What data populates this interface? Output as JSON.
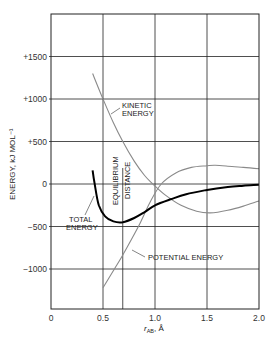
{
  "chart_data": {
    "type": "line",
    "title": "",
    "xlabel": "r_AB, Å",
    "xlabel_main": "r",
    "xlabel_sub": "AB",
    "xlabel_unit": ", Å",
    "ylabel": "ENERGY, kJ MOL⁻¹",
    "xlim": [
      0,
      2.0
    ],
    "ylim": [
      -1470,
      1980
    ],
    "grid": true,
    "legend_position": "inline annotations",
    "x_ticks": [
      0,
      0.5,
      1.0,
      1.5,
      2.0
    ],
    "x_tick_labels": [
      "0",
      "0.5",
      "1.0",
      "1.5",
      "2.0"
    ],
    "y_ticks": [
      1500,
      1000,
      500,
      0,
      -500,
      -1000
    ],
    "y_tick_labels": [
      "+1500",
      "+1000",
      "+500",
      "0",
      "−500",
      "−1000"
    ],
    "series": [
      {
        "name": "KINETIC ENERGY",
        "color": "#8a8a8a",
        "x": [
          0.4,
          0.5,
          0.6,
          0.69,
          0.8,
          0.9,
          0.98,
          1.1,
          1.25,
          1.4,
          1.53,
          1.7,
          1.85,
          2.0
        ],
        "y": [
          1300,
          1000,
          720,
          500,
          270,
          100,
          0,
          -130,
          -250,
          -320,
          -340,
          -310,
          -260,
          -200
        ]
      },
      {
        "name": "POTENTIAL ENERGY",
        "color": "#8a8a8a",
        "x": [
          0.5,
          0.61,
          0.69,
          0.84,
          0.95,
          1.06,
          1.2,
          1.35,
          1.5,
          1.58,
          1.7,
          1.85,
          2.0
        ],
        "y": [
          -1220,
          -1000,
          -835,
          -500,
          -220,
          0,
          130,
          195,
          215,
          220,
          210,
          195,
          180
        ]
      },
      {
        "name": "TOTAL ENERGY",
        "color": "#000000",
        "x": [
          0.4,
          0.42,
          0.46,
          0.52,
          0.6,
          0.69,
          0.8,
          0.9,
          1.0,
          1.15,
          1.3,
          1.5,
          1.7,
          1.85,
          2.0
        ],
        "y": [
          160,
          0,
          -250,
          -380,
          -440,
          -450,
          -400,
          -330,
          -250,
          -180,
          -120,
          -70,
          -35,
          -20,
          -10
        ]
      }
    ],
    "annotations": [
      {
        "text": "KINETIC ENERGY",
        "lines": [
          "KINETIC",
          "ENERGY"
        ]
      },
      {
        "text": "TOTAL ENERGY",
        "lines": [
          "TOTAL",
          "ENERGY"
        ]
      },
      {
        "text": "POTENTIAL ENERGY",
        "lines": [
          "POTENTIAL ENERGY"
        ]
      },
      {
        "text": "EQUILIBRIUM DISTANCE",
        "lines": [
          "EQUILIBRIUM",
          "DISTANCE"
        ],
        "x": 0.69
      }
    ],
    "equilibrium_distance": 0.69
  }
}
